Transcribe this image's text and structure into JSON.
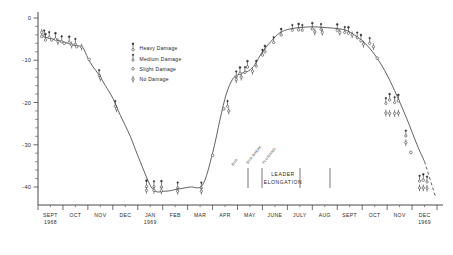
{
  "chart_data": {
    "type": "scatter",
    "title": "",
    "xlabel": "",
    "ylabel": "",
    "ylim": [
      -45,
      1
    ],
    "xlim": [
      0,
      16
    ],
    "grid": false,
    "legend_position": "upper-left-inside",
    "y_ticks": [
      "0",
      "-10",
      "-20",
      "-30",
      "-40"
    ],
    "y_tick_values": [
      0,
      -10,
      -20,
      -30,
      -40
    ],
    "y_minor_interval": 2,
    "x_ticks": [
      {
        "label": "SEPT",
        "sublabel": "1968"
      },
      {
        "label": "OCT",
        "sublabel": ""
      },
      {
        "label": "NOV",
        "sublabel": ""
      },
      {
        "label": "DEC",
        "sublabel": ""
      },
      {
        "label": "JAN",
        "sublabel": "1969"
      },
      {
        "label": "FEB",
        "sublabel": ""
      },
      {
        "label": "MAR",
        "sublabel": ""
      },
      {
        "label": "APR",
        "sublabel": ""
      },
      {
        "label": "MAY",
        "sublabel": ""
      },
      {
        "label": "JUNE",
        "sublabel": ""
      },
      {
        "label": "JULY",
        "sublabel": ""
      },
      {
        "label": "AUG",
        "sublabel": ""
      },
      {
        "label": "SEPT",
        "sublabel": ""
      },
      {
        "label": "OCT",
        "sublabel": ""
      },
      {
        "label": "NOV",
        "sublabel": ""
      },
      {
        "label": "DEC",
        "sublabel": "1969"
      }
    ],
    "legend": [
      {
        "symbol": "heavy-damage-marker",
        "label": "Heavy Damage"
      },
      {
        "symbol": "medium-damage-marker",
        "label": "Medium Damage"
      },
      {
        "symbol": "slight-damage-marker",
        "label": "Slight Damage"
      },
      {
        "symbol": "no-damage-marker",
        "label": "No Damage"
      }
    ],
    "annotations": [
      {
        "name": "leader-elongation",
        "text": "LEADER",
        "text2": "ELONGATION"
      },
      {
        "name": "phenology-stage-1",
        "text": "BUD"
      },
      {
        "name": "phenology-stage-2",
        "text": "BUD BREAK"
      },
      {
        "name": "phenology-stage-3",
        "text": "FLUSHING"
      }
    ],
    "series": [
      {
        "name": "hardiness-curve",
        "style": "solid-line",
        "x": [
          0.25,
          0.6,
          1.0,
          1.35,
          1.6,
          1.8,
          2.0,
          2.2,
          2.45,
          2.7,
          3.0,
          3.3,
          3.7,
          4.1,
          4.6,
          5.1,
          5.6,
          6.1,
          6.6,
          7.0,
          7.3,
          7.55,
          7.8,
          8.0,
          8.2,
          8.45,
          8.7,
          9.0,
          9.35,
          9.7,
          10.1,
          10.6,
          11.1,
          11.6,
          12.0,
          12.4,
          12.8,
          13.2,
          13.6,
          14.0,
          14.4,
          14.8,
          15.2,
          15.5
        ],
        "y": [
          -4.5,
          -5.0,
          -5.6,
          -6.3,
          -6.6,
          -7.0,
          -9.5,
          -11.5,
          -13.5,
          -16.0,
          -19.0,
          -23.0,
          -28.0,
          -34.0,
          -40.5,
          -41.0,
          -40.5,
          -40.0,
          -39.5,
          -32.0,
          -24.0,
          -18.0,
          -14.5,
          -13.5,
          -13.0,
          -12.5,
          -11.0,
          -8.0,
          -5.5,
          -3.5,
          -2.6,
          -2.2,
          -2.1,
          -2.3,
          -2.5,
          -3.0,
          -4.5,
          -6.5,
          -9.5,
          -13.5,
          -18.5,
          -24.0,
          -30.0,
          -34.0
        ]
      },
      {
        "name": "hardiness-curve-extrapolated",
        "style": "dashed-line",
        "x": [
          15.5,
          15.95
        ],
        "y": [
          -34.0,
          -42.5
        ]
      }
    ],
    "data_points": [
      {
        "x": 0.15,
        "y": -3.4,
        "damage": "no"
      },
      {
        "x": 0.15,
        "y": -4.4,
        "damage": "slight"
      },
      {
        "x": 0.25,
        "y": -3.8,
        "damage": "medium"
      },
      {
        "x": 0.3,
        "y": -4.8,
        "damage": "heavy"
      },
      {
        "x": 0.45,
        "y": -4.2,
        "damage": "medium"
      },
      {
        "x": 0.55,
        "y": -5.2,
        "damage": "slight"
      },
      {
        "x": 0.7,
        "y": -4.6,
        "damage": "heavy"
      },
      {
        "x": 0.8,
        "y": -5.6,
        "damage": "no"
      },
      {
        "x": 0.95,
        "y": -5.2,
        "damage": "medium"
      },
      {
        "x": 1.05,
        "y": -6.0,
        "damage": "slight"
      },
      {
        "x": 1.25,
        "y": -5.4,
        "damage": "heavy"
      },
      {
        "x": 1.35,
        "y": -6.4,
        "damage": "no"
      },
      {
        "x": 1.5,
        "y": -5.8,
        "damage": "medium"
      },
      {
        "x": 1.55,
        "y": -6.8,
        "damage": "slight"
      },
      {
        "x": 1.75,
        "y": -6.9,
        "damage": "no"
      },
      {
        "x": 2.05,
        "y": -9.8,
        "damage": "slight"
      },
      {
        "x": 2.45,
        "y": -13.2,
        "damage": "medium"
      },
      {
        "x": 2.5,
        "y": -14.2,
        "damage": "no"
      },
      {
        "x": 3.1,
        "y": -20.5,
        "damage": "medium"
      },
      {
        "x": 3.15,
        "y": -21.5,
        "damage": "no"
      },
      {
        "x": 4.35,
        "y": -39.5,
        "damage": "heavy"
      },
      {
        "x": 4.35,
        "y": -40.8,
        "damage": "no"
      },
      {
        "x": 4.65,
        "y": -39.5,
        "damage": "medium"
      },
      {
        "x": 4.65,
        "y": -40.8,
        "damage": "no"
      },
      {
        "x": 4.95,
        "y": -39.6,
        "damage": "heavy"
      },
      {
        "x": 4.95,
        "y": -40.9,
        "damage": "no"
      },
      {
        "x": 5.6,
        "y": -39.8,
        "damage": "medium"
      },
      {
        "x": 5.6,
        "y": -41.0,
        "damage": "no"
      },
      {
        "x": 6.55,
        "y": -39.8,
        "damage": "medium"
      },
      {
        "x": 6.55,
        "y": -41.0,
        "damage": "no"
      },
      {
        "x": 7.0,
        "y": -32.5,
        "damage": "slight"
      },
      {
        "x": 7.45,
        "y": -21.5,
        "damage": "slight"
      },
      {
        "x": 7.6,
        "y": -20.5,
        "damage": "medium"
      },
      {
        "x": 7.65,
        "y": -22.0,
        "damage": "no"
      },
      {
        "x": 7.95,
        "y": -13.5,
        "damage": "medium"
      },
      {
        "x": 7.95,
        "y": -14.6,
        "damage": "no"
      },
      {
        "x": 8.1,
        "y": -12.7,
        "damage": "heavy"
      },
      {
        "x": 8.15,
        "y": -14.0,
        "damage": "no"
      },
      {
        "x": 8.3,
        "y": -12.5,
        "damage": "medium"
      },
      {
        "x": 8.4,
        "y": -11.2,
        "damage": "heavy"
      },
      {
        "x": 8.6,
        "y": -12.6,
        "damage": "no"
      },
      {
        "x": 8.75,
        "y": -11.0,
        "damage": "medium"
      },
      {
        "x": 9.0,
        "y": -8.4,
        "damage": "medium"
      },
      {
        "x": 9.1,
        "y": -7.6,
        "damage": "heavy"
      },
      {
        "x": 9.45,
        "y": -5.4,
        "damage": "medium"
      },
      {
        "x": 9.75,
        "y": -3.6,
        "damage": "heavy"
      },
      {
        "x": 10.2,
        "y": -2.5,
        "damage": "medium"
      },
      {
        "x": 10.45,
        "y": -2.4,
        "damage": "heavy"
      },
      {
        "x": 10.6,
        "y": -2.5,
        "damage": "medium"
      },
      {
        "x": 11.0,
        "y": -2.2,
        "damage": "heavy"
      },
      {
        "x": 11.1,
        "y": -3.3,
        "damage": "no"
      },
      {
        "x": 11.35,
        "y": -2.3,
        "damage": "medium"
      },
      {
        "x": 11.4,
        "y": -3.4,
        "damage": "no"
      },
      {
        "x": 12.0,
        "y": -2.5,
        "damage": "heavy"
      },
      {
        "x": 12.1,
        "y": -3.4,
        "damage": "no"
      },
      {
        "x": 12.3,
        "y": -3.0,
        "damage": "medium"
      },
      {
        "x": 12.45,
        "y": -3.2,
        "damage": "heavy"
      },
      {
        "x": 12.6,
        "y": -4.0,
        "damage": "no"
      },
      {
        "x": 12.8,
        "y": -4.3,
        "damage": "medium"
      },
      {
        "x": 12.95,
        "y": -5.0,
        "damage": "heavy"
      },
      {
        "x": 13.05,
        "y": -6.2,
        "damage": "no"
      },
      {
        "x": 13.3,
        "y": -5.6,
        "damage": "medium"
      },
      {
        "x": 13.45,
        "y": -6.8,
        "damage": "no"
      },
      {
        "x": 13.6,
        "y": -9.5,
        "damage": "slight"
      },
      {
        "x": 13.95,
        "y": -19.8,
        "damage": "medium"
      },
      {
        "x": 13.95,
        "y": -22.5,
        "damage": "no"
      },
      {
        "x": 14.1,
        "y": -19.0,
        "damage": "heavy"
      },
      {
        "x": 14.1,
        "y": -22.6,
        "damage": "no"
      },
      {
        "x": 14.3,
        "y": -19.6,
        "damage": "medium"
      },
      {
        "x": 14.3,
        "y": -22.6,
        "damage": "no"
      },
      {
        "x": 14.45,
        "y": -19.2,
        "damage": "heavy"
      },
      {
        "x": 14.45,
        "y": -22.5,
        "damage": "no"
      },
      {
        "x": 14.75,
        "y": -27.5,
        "damage": "medium"
      },
      {
        "x": 14.75,
        "y": -29.5,
        "damage": "no"
      },
      {
        "x": 14.95,
        "y": -31.8,
        "damage": "slight"
      },
      {
        "x": 15.3,
        "y": -38.2,
        "damage": "medium"
      },
      {
        "x": 15.3,
        "y": -40.2,
        "damage": "no"
      },
      {
        "x": 15.45,
        "y": -38.0,
        "damage": "heavy"
      },
      {
        "x": 15.45,
        "y": -40.2,
        "damage": "no"
      },
      {
        "x": 15.6,
        "y": -38.4,
        "damage": "medium"
      },
      {
        "x": 15.6,
        "y": -40.3,
        "damage": "no"
      }
    ]
  }
}
